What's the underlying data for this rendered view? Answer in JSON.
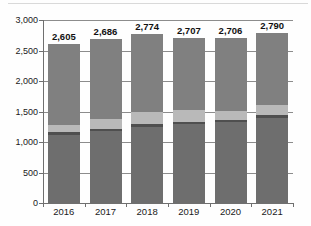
{
  "chart_data": {
    "type": "bar",
    "subtype": "stacked-column",
    "title": "",
    "subtitle": "",
    "xlabel": "",
    "ylabel": "",
    "categories": [
      "2016",
      "2017",
      "2018",
      "2019",
      "2020",
      "2021"
    ],
    "ylim": [
      0,
      3000
    ],
    "y_ticks": [
      0,
      500,
      1000,
      1500,
      2000,
      2500,
      3000
    ],
    "y_tick_labels": [
      "0",
      "500",
      "1,000",
      "1,500",
      "2,000",
      "2,500",
      "3,000"
    ],
    "grid": true,
    "grid_axis": "y",
    "legend": false,
    "legend_position": "none",
    "totals": [
      2605,
      2686,
      2774,
      2707,
      2706,
      2790
    ],
    "total_labels": [
      "2,605",
      "2,686",
      "2,774",
      "2,707",
      "2,706",
      "2,790"
    ],
    "series": [
      {
        "name": "segment-base",
        "color": "#6e6e6e",
        "values": [
          1120,
          1175,
          1245,
          1290,
          1320,
          1400
        ]
      },
      {
        "name": "segment-band",
        "color": "#4f4f4f",
        "values": [
          45,
          45,
          45,
          45,
          45,
          45
        ]
      },
      {
        "name": "segment-light",
        "color": "#b9b9b9",
        "values": [
          115,
          165,
          200,
          190,
          150,
          160
        ]
      },
      {
        "name": "segment-top",
        "color": "#808080",
        "values": [
          1325,
          1301,
          1284,
          1182,
          1191,
          1185
        ]
      }
    ]
  },
  "colors": {
    "segment_base": "#6e6e6e",
    "segment_band": "#4f4f4f",
    "segment_light": "#b9b9b9",
    "segment_top": "#808080",
    "gridline": "#8c8c8c",
    "axis": "#6f6f6f",
    "text": "#1a1a1a",
    "background": "#ffffff"
  }
}
